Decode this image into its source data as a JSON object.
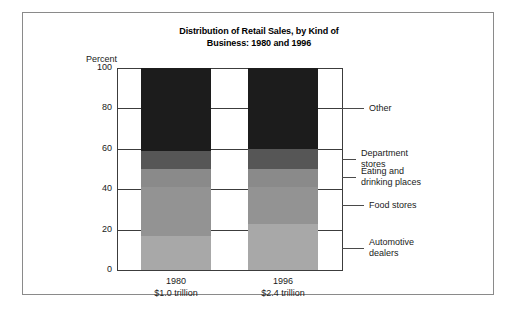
{
  "chart_data": {
    "type": "bar",
    "subtype": "stacked-100-percent",
    "title": "Distribution of Retail Sales, by Kind of Business: 1980 and 1996",
    "title_line1": "Distribution of Retail Sales, by Kind of",
    "title_line2": "Business: 1980 and 1996",
    "xlabel": "",
    "ylabel": "Percent",
    "ylim": [
      0,
      100
    ],
    "yticks": [
      0,
      20,
      40,
      60,
      80,
      100
    ],
    "ytick_labels": [
      "0",
      "20",
      "40",
      "60",
      "80",
      "100"
    ],
    "grid": true,
    "legend_position": "right-callouts",
    "categories": [
      "1980",
      "1996"
    ],
    "category_sublabels": [
      "$1.0 trillion",
      "$2.4 trillion"
    ],
    "series": [
      {
        "name": "Automotive dealers",
        "values": [
          17,
          23
        ],
        "color": "#a8a8a8"
      },
      {
        "name": "Food stores",
        "values": [
          24,
          18
        ],
        "color": "#939393"
      },
      {
        "name": "Eating and drinking places",
        "values": [
          9,
          9
        ],
        "color": "#8a8a8a"
      },
      {
        "name": "Department stores",
        "values": [
          9,
          10
        ],
        "color": "#565656"
      },
      {
        "name": "Other",
        "values": [
          41,
          40
        ],
        "color": "#1c1c1c"
      }
    ],
    "stack_order_bottom_to_top": [
      "Automotive dealers",
      "Food stores",
      "Eating and drinking places",
      "Department stores",
      "Other"
    ]
  },
  "axis": {
    "y_axis_title": "Percent",
    "ticks": [
      {
        "value": 100,
        "label": "100"
      },
      {
        "value": 80,
        "label": "80"
      },
      {
        "value": 60,
        "label": "60"
      },
      {
        "value": 40,
        "label": "40"
      },
      {
        "value": 20,
        "label": "20"
      },
      {
        "value": 0,
        "label": "0"
      }
    ]
  },
  "bars": [
    {
      "id": "1980",
      "year_label": "1980",
      "total_label": "$1.0 trillion",
      "segments": [
        {
          "name": "Other",
          "value": 41,
          "from": 59,
          "to": 100,
          "color": "#1c1c1c"
        },
        {
          "name": "Department stores",
          "value": 9,
          "from": 50,
          "to": 59,
          "color": "#565656"
        },
        {
          "name": "Eating and drinking places",
          "value": 9,
          "from": 41,
          "to": 50,
          "color": "#8a8a8a"
        },
        {
          "name": "Food stores",
          "value": 24,
          "from": 17,
          "to": 41,
          "color": "#939393"
        },
        {
          "name": "Automotive dealers",
          "value": 17,
          "from": 0,
          "to": 17,
          "color": "#a8a8a8"
        }
      ]
    },
    {
      "id": "1996",
      "year_label": "1996",
      "total_label": "$2.4 trillion",
      "segments": [
        {
          "name": "Other",
          "value": 40,
          "from": 60,
          "to": 100,
          "color": "#1c1c1c"
        },
        {
          "name": "Department stores",
          "value": 10,
          "from": 50,
          "to": 60,
          "color": "#565656"
        },
        {
          "name": "Eating and drinking places",
          "value": 9,
          "from": 41,
          "to": 50,
          "color": "#8a8a8a"
        },
        {
          "name": "Food stores",
          "value": 18,
          "from": 23,
          "to": 41,
          "color": "#939393"
        },
        {
          "name": "Automotive dealers",
          "value": 23,
          "from": 0,
          "to": 23,
          "color": "#a8a8a8"
        }
      ]
    }
  ],
  "legend": {
    "items": [
      {
        "label": "Other",
        "line1": "Other",
        "line2": "",
        "anchor_percent": 80
      },
      {
        "label": "Department stores",
        "line1": "Department",
        "line2": "stores",
        "anchor_percent": 55
      },
      {
        "label": "Eating and drinking places",
        "line1": "Eating and",
        "line2": "drinking places",
        "anchor_percent": 46
      },
      {
        "label": "Food stores",
        "line1": "Food stores",
        "line2": "",
        "anchor_percent": 32
      },
      {
        "label": "Automotive dealers",
        "line1": "Automotive",
        "line2": "dealers",
        "anchor_percent": 11
      }
    ]
  },
  "colors": {
    "other": "#1c1c1c",
    "department_stores": "#565656",
    "eating_drinking": "#8a8a8a",
    "food_stores": "#939393",
    "automotive_dealers": "#a8a8a8",
    "frame": "#8a8a8a",
    "axis": "#3c3c3c",
    "background": "#ffffff",
    "text": "#1a1a1a"
  }
}
